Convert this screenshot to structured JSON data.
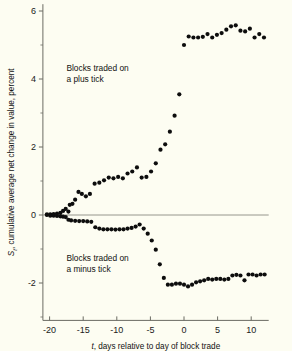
{
  "chart_data": {
    "type": "scatter",
    "title": "",
    "xlabel": "t, days relative to day of block trade",
    "ylabel": "S_t, cumulative average net change in value, percent",
    "ylabel_parts": {
      "symbol": "S",
      "subscript": "t",
      "rest": ", cumulative average net change in value, percent"
    },
    "xlabel_parts": {
      "symbol": "t",
      "rest": ", days relative to day of block trade"
    },
    "xlim": [
      -21,
      12.6
    ],
    "ylim": [
      -3.1,
      6.2
    ],
    "xticks": [
      -20,
      -15,
      -10,
      -5,
      0,
      5,
      10
    ],
    "xtick_labels": [
      "-20",
      "-15",
      "-10",
      "-5",
      "0",
      "5",
      "10"
    ],
    "yticks": [
      6,
      4,
      2,
      0,
      -2
    ],
    "ytick_labels": [
      "6",
      "4",
      "2",
      "0",
      "-2"
    ],
    "yticks_minor": [
      5,
      3,
      1,
      -1,
      -3
    ],
    "grid": false,
    "zero_line": true,
    "legend": "none",
    "marker": "filled-circle",
    "marker_color": "#0d0d0d",
    "background_color": "#fdfdf2",
    "axis_color": "#6b6b63",
    "annotations": [
      {
        "text_line1": "Blocks traded on",
        "text_line2": "a plus tick",
        "x": -17.5,
        "y": 4.25
      },
      {
        "text_line1": "Blocks traded on",
        "text_line2": "a minus tick",
        "x": -17.5,
        "y": -1.35
      }
    ],
    "series": [
      {
        "name": "Blocks traded on a plus tick",
        "x": [
          -20.4,
          -19.9,
          -19.4,
          -18.9,
          -18.4,
          -18.0,
          -17.6,
          -17.2,
          -17.0,
          -16.6,
          -16.2,
          -15.7,
          -15.2,
          -14.6,
          -14.0,
          -13.3,
          -12.6,
          -11.9,
          -11.2,
          -10.5,
          -9.8,
          -9.1,
          -8.4,
          -7.7,
          -7.0,
          -6.3,
          -5.6,
          -4.9,
          -4.2,
          -3.5,
          -2.8,
          -2.1,
          -1.4,
          -0.7,
          0.0,
          0.7,
          1.4,
          2.1,
          2.8,
          3.5,
          4.2,
          4.9,
          5.6,
          6.3,
          7.0,
          7.7,
          8.4,
          9.1,
          9.8,
          10.5,
          11.2,
          11.9
        ],
        "y": [
          0.02,
          0.02,
          0.03,
          0.04,
          0.06,
          0.12,
          0.18,
          0.1,
          0.3,
          0.33,
          0.45,
          0.68,
          0.62,
          0.55,
          0.62,
          0.92,
          0.95,
          1.02,
          1.1,
          1.08,
          1.12,
          1.08,
          1.22,
          1.28,
          1.4,
          1.1,
          1.12,
          1.28,
          1.52,
          1.92,
          2.08,
          2.45,
          2.92,
          3.55,
          5.0,
          5.25,
          5.22,
          5.22,
          5.24,
          5.32,
          5.22,
          5.3,
          5.35,
          5.45,
          5.55,
          5.58,
          5.42,
          5.4,
          5.48,
          5.22,
          5.32,
          5.22
        ]
      },
      {
        "name": "Blocks traded on a minus tick",
        "x": [
          -20.4,
          -19.9,
          -19.4,
          -18.9,
          -18.4,
          -18.0,
          -17.6,
          -17.2,
          -16.8,
          -16.2,
          -15.6,
          -15.0,
          -14.4,
          -13.8,
          -13.2,
          -12.6,
          -12.0,
          -11.4,
          -10.8,
          -10.2,
          -9.6,
          -9.0,
          -8.4,
          -7.8,
          -7.2,
          -6.6,
          -6.0,
          -5.4,
          -4.8,
          -4.2,
          -3.6,
          -3.0,
          -2.4,
          -1.8,
          -1.2,
          -0.6,
          0.0,
          0.6,
          1.2,
          1.8,
          2.4,
          3.0,
          3.6,
          4.2,
          4.8,
          5.4,
          6.0,
          6.6,
          7.2,
          7.8,
          8.4,
          9.0,
          9.6,
          10.2,
          10.8,
          11.4,
          12.0
        ],
        "y": [
          0.0,
          -0.02,
          -0.02,
          -0.03,
          -0.04,
          -0.05,
          -0.06,
          -0.14,
          -0.16,
          -0.17,
          -0.18,
          -0.18,
          -0.19,
          -0.2,
          -0.36,
          -0.4,
          -0.42,
          -0.42,
          -0.42,
          -0.43,
          -0.42,
          -0.42,
          -0.4,
          -0.38,
          -0.34,
          -0.28,
          -0.4,
          -0.55,
          -0.75,
          -1.02,
          -1.45,
          -1.85,
          -2.05,
          -2.05,
          -2.02,
          -2.02,
          -2.05,
          -2.1,
          -2.05,
          -1.98,
          -1.95,
          -1.92,
          -1.88,
          -1.9,
          -1.88,
          -1.88,
          -1.9,
          -1.88,
          -1.78,
          -1.76,
          -1.78,
          -1.92,
          -1.75,
          -1.75,
          -1.78,
          -1.75,
          -1.75
        ]
      }
    ]
  }
}
